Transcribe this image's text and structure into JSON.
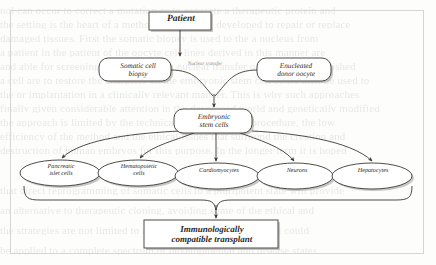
{
  "figure": {
    "kind": "flow-diagram",
    "title_in_image": "",
    "nodes": [
      {
        "id": "patient",
        "label": "Patient",
        "shape": "rectangle",
        "bold": true
      },
      {
        "id": "somatic",
        "label": "Somatic cell\nbiopsy",
        "shape": "rounded-rectangle",
        "bold": false
      },
      {
        "id": "oocyte",
        "label": "Enucleated\ndonor oocyte",
        "shape": "rounded-rectangle",
        "bold": false
      },
      {
        "id": "escells",
        "label": "Embryonic\nstem cells",
        "shape": "rounded-rectangle",
        "bold": false
      },
      {
        "id": "pancreatic",
        "label": "Pancreatic\nislet cells",
        "shape": "ellipse",
        "bold": false
      },
      {
        "id": "hemato",
        "label": "Hematopoietic\ncells",
        "shape": "ellipse",
        "bold": false
      },
      {
        "id": "cardio",
        "label": "Cardiomyocytes",
        "shape": "ellipse",
        "bold": false
      },
      {
        "id": "neurons",
        "label": "Neurons",
        "shape": "ellipse",
        "bold": false
      },
      {
        "id": "hepato",
        "label": "Hepatocytes",
        "shape": "ellipse",
        "bold": false
      },
      {
        "id": "transplant",
        "label": "Immunologically\ncompatible transplant",
        "shape": "rectangle",
        "bold": true
      }
    ],
    "edge_labels": [
      {
        "id": "nuclear-transfer",
        "label": "Nuclear transfer"
      }
    ],
    "node_text": {
      "patient": "Patient",
      "somatic_line1": "Somatic cell",
      "somatic_line2": "biopsy",
      "oocyte_line1": "Enucleated",
      "oocyte_line2": "donor oocyte",
      "nuclear_transfer": "Nuclear transfer",
      "escells_line1": "Embryonic",
      "escells_line2": "stem cells",
      "pancreatic_line1": "Pancreatic",
      "pancreatic_line2": "islet cells",
      "hemato_line1": "Hematopoietic",
      "hemato_line2": "cells",
      "cardio": "Cardiomyocytes",
      "neurons": "Neurons",
      "hepato": "Hepatocytes",
      "transplant_line1": "Immunologically",
      "transplant_line2": "compatible transplant"
    },
    "colors": {
      "ink": "#2b2a28",
      "stroke": "#3a3936",
      "shadow": "#b6b4af",
      "frame": "#d7d5d0",
      "paper": "#fdfdfc",
      "ghost": "#b9b7b2",
      "faint_label": "#8d8b86"
    }
  },
  "background_ghost_text": {
    "note": "faded show-through text from the reverse page, illegible",
    "lines": [
      "nol can occur to correct a mutation or to generate a therapeutic protein and",
      "the setting is the heart of a method that is being developed to repair or replace",
      "damaged tissues. First the somatic biopsy is used to the a nucleus from",
      "a patient in the patient of the oocyte cell lines derived in this manner are",
      "and able for screening the line. For the nuclear transfer of paired and published",
      "a cell are to restore the character on the embryonic stem cell could then be used to",
      "the or implantation in a clinically relevant manner. This is why such approaches",
      "finally given considerable attention in the developed world and genetically modified",
      "the approach is limited by the technical demands of the procedure, the low",
      "efficiency of the method and the ethical issues that surround the creation and",
      "destruction of human embryos for this purpose. In the longer term it is hoped",
      "that direct reprogramming of somatic cells to a pluripotent state will provide",
      "an alternative to therapeutic cloning, avoiding some of the ethical and",
      "the strategies are not limited to a single or a few cell types and could",
      "be applied to a complete spectrum of developmental and disease states"
    ]
  }
}
